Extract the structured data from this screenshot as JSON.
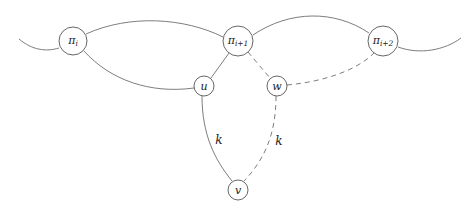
{
  "diagram": {
    "nodes": [
      {
        "id": "pi_i",
        "base": "π",
        "sub": "i",
        "cx": 73,
        "cy": 41,
        "r": 14
      },
      {
        "id": "pi_i1",
        "base": "π",
        "sub": "i+1",
        "cx": 238,
        "cy": 41,
        "r": 15
      },
      {
        "id": "pi_i2",
        "base": "π",
        "sub": "i+2",
        "cx": 383,
        "cy": 41,
        "r": 15
      },
      {
        "id": "u",
        "base": "u",
        "sub": "",
        "cx": 204,
        "cy": 86,
        "r": 10
      },
      {
        "id": "w",
        "base": "w",
        "sub": "",
        "cx": 277,
        "cy": 86,
        "r": 10
      },
      {
        "id": "v",
        "base": "v",
        "sub": "",
        "cx": 238,
        "cy": 190,
        "r": 10
      }
    ],
    "edges": [
      {
        "from": "open-left",
        "to": "pi_i",
        "style": "solid"
      },
      {
        "from": "pi_i",
        "to": "pi_i1",
        "style": "solid",
        "shape": "upper-arc"
      },
      {
        "from": "pi_i",
        "to": "u",
        "style": "solid",
        "shape": "lower-arc"
      },
      {
        "from": "pi_i1",
        "to": "pi_i2",
        "style": "solid",
        "shape": "upper-arc"
      },
      {
        "from": "pi_i2",
        "to": "open-right",
        "style": "solid"
      },
      {
        "from": "pi_i1",
        "to": "u",
        "style": "solid"
      },
      {
        "from": "pi_i1",
        "to": "w",
        "style": "dashed"
      },
      {
        "from": "w",
        "to": "pi_i2",
        "style": "dashed"
      },
      {
        "from": "u",
        "to": "v",
        "style": "solid",
        "label": "k"
      },
      {
        "from": "w",
        "to": "v",
        "style": "dashed",
        "label": "k"
      }
    ],
    "edge_labels": {
      "uv": "k",
      "wv": "k"
    },
    "colors": {
      "edge": "#6e6e6e",
      "node_stroke": "#555555",
      "text": "#222222",
      "background": "#ffffff"
    }
  }
}
